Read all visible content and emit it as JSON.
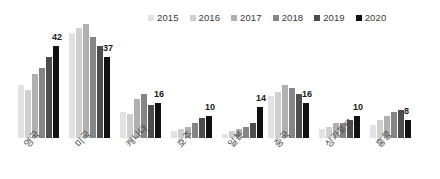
{
  "chart_data": {
    "type": "bar",
    "title": "",
    "subtitle": "",
    "xlabel": "",
    "ylabel": "",
    "grid": false,
    "legend_position": "top-right",
    "categories": [
      "영국",
      "미국",
      "캐나다",
      "호주",
      "일본",
      "중국",
      "싱가포르",
      "홍콩"
    ],
    "series": [
      {
        "name": "2015",
        "color": "#e2e2e2",
        "values": [
          24,
          48,
          12,
          3,
          2,
          19,
          4,
          6
        ]
      },
      {
        "name": "2016",
        "color": "#cfcfcf",
        "values": [
          22,
          50,
          11,
          4,
          3,
          21,
          5,
          8
        ]
      },
      {
        "name": "2017",
        "color": "#b0b0b0",
        "values": [
          29,
          52,
          18,
          5,
          4,
          24,
          7,
          10
        ]
      },
      {
        "name": "2018",
        "color": "#858585",
        "values": [
          32,
          46,
          20,
          7,
          5,
          23,
          7,
          12
        ]
      },
      {
        "name": "2019",
        "color": "#4d4d4d",
        "values": [
          37,
          42,
          15,
          9,
          7,
          20,
          8,
          13
        ]
      },
      {
        "name": "2020",
        "color": "#111111",
        "values": [
          42,
          37,
          16,
          10,
          14,
          16,
          10,
          8
        ]
      }
    ],
    "value_labels": {
      "series": "2020",
      "values": [
        42,
        37,
        16,
        10,
        14,
        16,
        10,
        8
      ]
    },
    "ylim": [
      0,
      52
    ]
  },
  "legend": {
    "items": [
      {
        "label": "2015",
        "color": "#e2e2e2"
      },
      {
        "label": "2016",
        "color": "#cfcfcf"
      },
      {
        "label": "2017",
        "color": "#b0b0b0"
      },
      {
        "label": "2018",
        "color": "#858585"
      },
      {
        "label": "2019",
        "color": "#4d4d4d"
      },
      {
        "label": "2020",
        "color": "#111111"
      }
    ]
  }
}
